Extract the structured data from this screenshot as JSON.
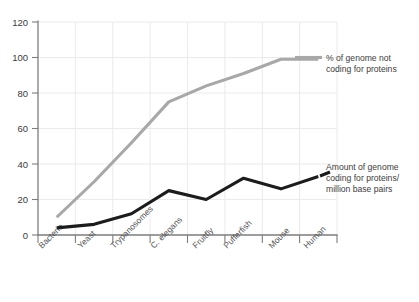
{
  "chart_data": {
    "type": "line",
    "title": "",
    "subtitle": "",
    "xlabel": "",
    "ylabel": "",
    "ylim": [
      0,
      120
    ],
    "yticks": [
      0,
      20,
      40,
      60,
      80,
      100,
      120
    ],
    "ytick_labels": [
      "0",
      "20",
      "40",
      "60",
      "80",
      "100",
      "120"
    ],
    "grid": true,
    "grid_axis": "both",
    "legend_position": "inline-right-annotations",
    "categories": [
      "Bacteria",
      "Yeast",
      "Trypanosomes",
      "C. elegans",
      "Fruitfly",
      "Pufferfish",
      "Mouse",
      "Human"
    ],
    "series": [
      {
        "name": "% of genome not coding for proteins",
        "color": "#a8a8a8",
        "values": [
          10,
          30,
          52,
          75,
          84,
          91,
          99,
          99
        ]
      },
      {
        "name": "Amount of genome coding for proteins/ million base pairs",
        "color": "#1c1c1c",
        "values": [
          4,
          6,
          12,
          25,
          20,
          32,
          26,
          33
        ]
      }
    ],
    "annotations": [
      {
        "id": "annotation-gray",
        "lines": [
          "% of genome not",
          "coding for proteins"
        ],
        "color": "#a8a8a8"
      },
      {
        "id": "annotation-black",
        "lines": [
          "Amount of genome",
          "coding for proteins/",
          "million base pairs"
        ],
        "color": "#1c1c1c"
      }
    ]
  },
  "axis": {
    "y_label_0": "0",
    "y_label_20": "20",
    "y_label_40": "40",
    "y_label_60": "60",
    "y_label_80": "80",
    "y_label_100": "100",
    "y_label_120": "120"
  },
  "xlabels": {
    "c0": "Bacteria",
    "c1": "Yeast",
    "c2": "Trypanosomes",
    "c3": "C. elegans",
    "c4": "Fruitfly",
    "c5": "Pufferfish",
    "c6": "Mouse",
    "c7": "Human"
  },
  "annotation_gray": {
    "line1": "% of genome not",
    "line2": "coding for proteins"
  },
  "annotation_black": {
    "line1": "Amount of genome",
    "line2": "coding for proteins/",
    "line3": "million base pairs"
  }
}
